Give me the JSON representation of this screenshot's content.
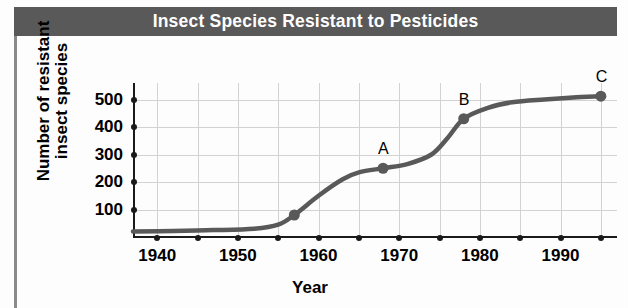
{
  "title": "Insect Species Resistant to Pesticides",
  "axis": {
    "y_title_line1": "Number of resistant",
    "y_title_line2": "insect species",
    "x_title": "Year"
  },
  "colors": {
    "banner": "#595959",
    "title_text": "#ffffff",
    "curve": "#595959",
    "gridline": "#d2d2d2",
    "axis": "#1a1a1a",
    "frame": "#8a8a8a"
  },
  "chart_data": {
    "type": "line",
    "title": "Insect Species Resistant to Pesticides",
    "xlabel": "Year",
    "ylabel": "Number of resistant insect species",
    "xlim": [
      1937,
      1997
    ],
    "ylim": [
      0,
      560
    ],
    "xticks": [
      1940,
      1950,
      1960,
      1970,
      1980,
      1990
    ],
    "xtick_labels": [
      "1940",
      "1950",
      "1960",
      "1970",
      "1980",
      "1990"
    ],
    "xminor_ticks": [
      1945,
      1955,
      1965,
      1975,
      1985,
      1995
    ],
    "yticks": [
      100,
      200,
      300,
      400,
      500
    ],
    "ytick_labels": [
      "100",
      "200",
      "300",
      "400",
      "500"
    ],
    "grid": true,
    "legend": null,
    "series": [
      {
        "name": "Resistant insect species",
        "x": [
          1937,
          1942,
          1947,
          1952,
          1955,
          1957,
          1960,
          1963,
          1965,
          1968,
          1971,
          1974,
          1976,
          1978,
          1981,
          1984,
          1988,
          1992,
          1995
        ],
        "values": [
          20,
          22,
          25,
          30,
          45,
          80,
          150,
          210,
          235,
          250,
          265,
          300,
          360,
          430,
          470,
          490,
          500,
          508,
          512
        ]
      }
    ],
    "markers": [
      {
        "label": "A",
        "x": 1968,
        "y": 250
      },
      {
        "label": "B",
        "x": 1978,
        "y": 430
      },
      {
        "label": "C",
        "x": 1995,
        "y": 512
      }
    ],
    "unlabeled_markers": [
      {
        "x": 1957,
        "y": 80
      }
    ]
  }
}
